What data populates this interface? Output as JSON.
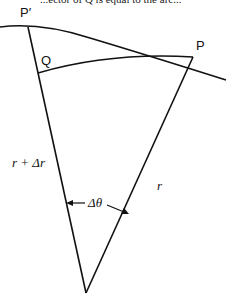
{
  "caption_fragment": "...ector of Q is equal to the arc...",
  "points": {
    "p_prime": "P′",
    "q": "Q",
    "p": "P"
  },
  "labels": {
    "outer_radius": "r + Δr",
    "inner_radius": "r",
    "angle": "Δθ"
  },
  "colors": {
    "stroke": "#111111",
    "background": "#ffffff"
  }
}
